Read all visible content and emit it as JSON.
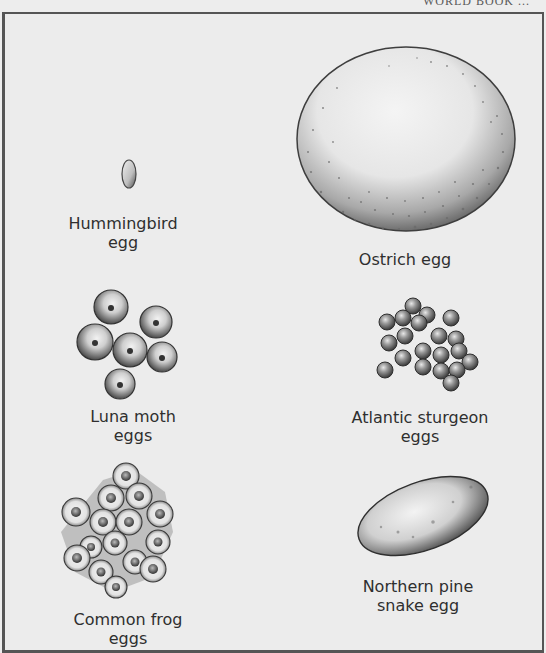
{
  "running_header": "WORLD BOOK ...",
  "figure": {
    "eggs": [
      {
        "id": "hummingbird",
        "label_line1": "Hummingbird",
        "label_line2": "egg"
      },
      {
        "id": "ostrich",
        "label_line1": "Ostrich egg",
        "label_line2": ""
      },
      {
        "id": "luna-moth",
        "label_line1": "Luna moth",
        "label_line2": "eggs"
      },
      {
        "id": "atlantic-sturgeon",
        "label_line1": "Atlantic sturgeon",
        "label_line2": "eggs"
      },
      {
        "id": "common-frog",
        "label_line1": "Common frog",
        "label_line2": "eggs"
      },
      {
        "id": "northern-pine-snake",
        "label_line1": "Northern pine",
        "label_line2": "snake egg"
      }
    ]
  },
  "colors": {
    "background": "#ececec",
    "border": "#555555",
    "ink": "#2f2f2f"
  }
}
